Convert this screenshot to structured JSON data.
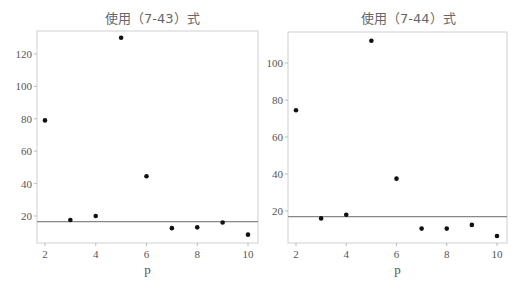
{
  "chart_data": [
    {
      "type": "scatter",
      "title": "使用（7-43）式",
      "xlabel": "p",
      "ylabel": "",
      "x": [
        2,
        3,
        4,
        5,
        6,
        7,
        8,
        9,
        10
      ],
      "series": [
        {
          "name": "Cp",
          "values": [
            79,
            17.5,
            20,
            130,
            44.5,
            12.5,
            13,
            16,
            8.5
          ]
        }
      ],
      "reference_line": {
        "type": "horizontal",
        "y": 16.5
      },
      "xticks": [
        2,
        4,
        6,
        8,
        10
      ],
      "yticks": [
        20,
        40,
        60,
        80,
        100,
        120
      ],
      "xlim": [
        1.7,
        10.4
      ],
      "ylim": [
        5,
        135
      ],
      "grid": false,
      "legend": false
    },
    {
      "type": "scatter",
      "title": "使用（7-44）式",
      "xlabel": "p",
      "ylabel": "",
      "x": [
        2,
        3,
        4,
        5,
        6,
        7,
        8,
        9,
        10
      ],
      "series": [
        {
          "name": "Cp",
          "values": [
            74.5,
            16,
            18,
            112,
            37.5,
            10.5,
            10.5,
            12.5,
            6.5
          ]
        }
      ],
      "reference_line": {
        "type": "horizontal",
        "y": 17
      },
      "xticks": [
        2,
        4,
        6,
        8,
        10
      ],
      "yticks": [
        20,
        40,
        60,
        80,
        100
      ],
      "xlim": [
        1.7,
        10.4
      ],
      "ylim": [
        3,
        117
      ],
      "grid": false,
      "legend": false
    }
  ],
  "panels": [
    {
      "title": "使用（7-43）式",
      "xlabel": "p"
    },
    {
      "title": "使用（7-44）式",
      "xlabel": "p"
    }
  ]
}
